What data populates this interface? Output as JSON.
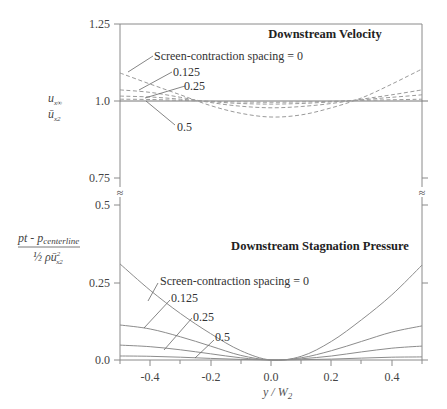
{
  "chart_data": [
    {
      "type": "line",
      "panel": "upper",
      "title": "Downstream Velocity",
      "xlabel": "y / W2",
      "ylabel": "u_x∞ / ū_x2",
      "xlim": [
        -0.5,
        0.5
      ],
      "ylim": [
        0.75,
        1.25
      ],
      "yticks": [
        "0.75",
        "1.0",
        "1.25"
      ],
      "line_style": "dashed",
      "x": [
        -0.5,
        -0.4,
        -0.3,
        -0.2,
        -0.1,
        0.0,
        0.1,
        0.2,
        0.3,
        0.4,
        0.5
      ],
      "series": [
        {
          "name": "Screen-contraction spacing = 0",
          "values": [
            1.091,
            1.055,
            1.02,
            0.985,
            0.96,
            0.948,
            0.955,
            0.978,
            1.01,
            1.055,
            1.104
          ]
        },
        {
          "name": "0.125",
          "values": [
            1.036,
            1.028,
            1.012,
            0.995,
            0.983,
            0.978,
            0.982,
            0.992,
            1.006,
            1.02,
            1.036
          ]
        },
        {
          "name": "0.25",
          "values": [
            1.016,
            1.013,
            1.006,
            0.998,
            0.992,
            0.99,
            0.992,
            0.997,
            1.004,
            1.012,
            1.02
          ]
        },
        {
          "name": "0.5",
          "values": [
            1.006,
            1.005,
            1.002,
            0.999,
            0.997,
            0.996,
            0.997,
            0.999,
            1.002,
            1.004,
            1.006
          ]
        }
      ]
    },
    {
      "type": "line",
      "panel": "lower",
      "title": "Downstream Stagnation Pressure",
      "xlabel": "y / W2",
      "ylabel": "(pt - p_centerline) / (½ ρ ū_x2²)",
      "xlim": [
        -0.5,
        0.5
      ],
      "ylim": [
        0.0,
        0.5
      ],
      "yticks": [
        "0.0",
        "0.25",
        "0.5"
      ],
      "xticks": [
        "-0.4",
        "-0.2",
        "0.0",
        "0.2",
        "0.4"
      ],
      "line_style": "solid",
      "x": [
        -0.5,
        -0.4,
        -0.3,
        -0.2,
        -0.1,
        0.0,
        0.1,
        0.2,
        0.3,
        0.4,
        0.5
      ],
      "series": [
        {
          "name": "Screen-contraction spacing = 0",
          "values": [
            0.31,
            0.225,
            0.15,
            0.085,
            0.03,
            0.0,
            0.012,
            0.06,
            0.13,
            0.21,
            0.306
          ]
        },
        {
          "name": "0.125",
          "values": [
            0.113,
            0.1,
            0.075,
            0.045,
            0.015,
            0.0,
            0.007,
            0.03,
            0.06,
            0.09,
            0.11
          ]
        },
        {
          "name": "0.25",
          "values": [
            0.048,
            0.043,
            0.033,
            0.02,
            0.007,
            0.0,
            0.004,
            0.013,
            0.026,
            0.038,
            0.045
          ]
        },
        {
          "name": "0.5",
          "values": [
            0.013,
            0.012,
            0.009,
            0.005,
            0.002,
            0.0,
            0.001,
            0.003,
            0.006,
            0.009,
            0.01
          ]
        }
      ]
    }
  ],
  "labels": {
    "upper_title": "Downstream Velocity",
    "lower_title": "Downstream Stagnation Pressure",
    "spacing_0": "Screen-contraction spacing = 0",
    "spacing_0125": "0.125",
    "spacing_025": "0.25",
    "spacing_05": "0.5",
    "xlabel": "y / W",
    "xlabel_sub": "2",
    "ytick_125": "1.25",
    "ytick_10": "1.0",
    "ytick_075": "0.75",
    "ytick_05": "0.5",
    "ytick_025": "0.25",
    "ytick_00": "0.0",
    "xtick_m04": "-0.4",
    "xtick_m02": "-0.2",
    "xtick_00": "0.0",
    "xtick_02": "0.2",
    "xtick_04": "0.4",
    "upper_ylabel_num": "u",
    "upper_ylabel_num_sub": "x∞",
    "upper_ylabel_den": "ū",
    "upper_ylabel_den_sub": "x2",
    "lower_ylabel_num": "pt - p",
    "lower_ylabel_num_sub": "centerline",
    "lower_ylabel_den": "½ ρū",
    "lower_ylabel_den_sub": "x2",
    "lower_ylabel_den_sup": "2",
    "break_mark": "≈"
  },
  "colors": {
    "axis": "#8a8a8a",
    "curve": "#8c8c8c",
    "dashed_curve": "#9a9a9a",
    "text": "#333333"
  }
}
